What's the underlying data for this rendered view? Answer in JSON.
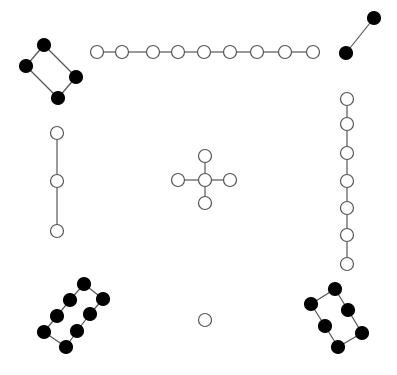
{
  "diagram": {
    "width": 397,
    "height": 375,
    "background": "#ffffff",
    "edge_color": "#555555",
    "node_radius": 6.5,
    "colors": {
      "black": "#000000",
      "white": "#ffffff",
      "stroke": "#555555"
    },
    "components": [
      {
        "name": "top-left-cycle",
        "nodes": [
          {
            "x": 44,
            "y": 45,
            "fill": "black"
          },
          {
            "x": 26,
            "y": 66,
            "fill": "black"
          },
          {
            "x": 76,
            "y": 77,
            "fill": "black"
          },
          {
            "x": 58,
            "y": 98,
            "fill": "black"
          }
        ],
        "edges": [
          [
            0,
            1
          ],
          [
            0,
            2
          ],
          [
            1,
            3
          ],
          [
            2,
            3
          ]
        ]
      },
      {
        "name": "top-horizontal-chain",
        "nodes": [
          {
            "x": 97,
            "y": 52,
            "fill": "white"
          },
          {
            "x": 122,
            "y": 52,
            "fill": "white"
          },
          {
            "x": 153,
            "y": 52,
            "fill": "white"
          },
          {
            "x": 178,
            "y": 52,
            "fill": "white"
          },
          {
            "x": 204,
            "y": 52,
            "fill": "white"
          },
          {
            "x": 230,
            "y": 52,
            "fill": "white"
          },
          {
            "x": 257,
            "y": 52,
            "fill": "white"
          },
          {
            "x": 285,
            "y": 52,
            "fill": "white"
          },
          {
            "x": 313,
            "y": 52,
            "fill": "white"
          }
        ],
        "edges": [
          [
            0,
            1
          ],
          [
            1,
            2
          ],
          [
            2,
            3
          ],
          [
            3,
            4
          ],
          [
            4,
            5
          ],
          [
            5,
            6
          ],
          [
            6,
            7
          ],
          [
            7,
            8
          ]
        ]
      },
      {
        "name": "top-right-pair",
        "nodes": [
          {
            "x": 374,
            "y": 18,
            "fill": "black"
          },
          {
            "x": 346,
            "y": 53,
            "fill": "black"
          }
        ],
        "edges": [
          [
            0,
            1
          ]
        ]
      },
      {
        "name": "left-vertical-chain",
        "nodes": [
          {
            "x": 57,
            "y": 133,
            "fill": "white"
          },
          {
            "x": 57,
            "y": 181,
            "fill": "white"
          },
          {
            "x": 57,
            "y": 231,
            "fill": "white"
          }
        ],
        "edges": [
          [
            0,
            1
          ],
          [
            1,
            2
          ]
        ]
      },
      {
        "name": "center-star",
        "nodes": [
          {
            "x": 205,
            "y": 180,
            "fill": "white"
          },
          {
            "x": 205,
            "y": 156,
            "fill": "white"
          },
          {
            "x": 178,
            "y": 180,
            "fill": "white"
          },
          {
            "x": 230,
            "y": 180,
            "fill": "white"
          },
          {
            "x": 205,
            "y": 203,
            "fill": "white"
          }
        ],
        "edges": [
          [
            0,
            1
          ],
          [
            0,
            2
          ],
          [
            0,
            3
          ],
          [
            0,
            4
          ]
        ]
      },
      {
        "name": "right-vertical-chain",
        "nodes": [
          {
            "x": 347,
            "y": 99,
            "fill": "white"
          },
          {
            "x": 347,
            "y": 124,
            "fill": "white"
          },
          {
            "x": 347,
            "y": 153,
            "fill": "white"
          },
          {
            "x": 347,
            "y": 181,
            "fill": "white"
          },
          {
            "x": 347,
            "y": 208,
            "fill": "white"
          },
          {
            "x": 347,
            "y": 235,
            "fill": "white"
          },
          {
            "x": 347,
            "y": 264,
            "fill": "white"
          }
        ],
        "edges": [
          [
            0,
            1
          ],
          [
            1,
            2
          ],
          [
            2,
            3
          ],
          [
            3,
            4
          ],
          [
            4,
            5
          ],
          [
            5,
            6
          ]
        ]
      },
      {
        "name": "bottom-left-cycle",
        "nodes": [
          {
            "x": 84,
            "y": 284,
            "fill": "black"
          },
          {
            "x": 103,
            "y": 299,
            "fill": "black"
          },
          {
            "x": 70,
            "y": 300,
            "fill": "black"
          },
          {
            "x": 90,
            "y": 314,
            "fill": "black"
          },
          {
            "x": 57,
            "y": 316,
            "fill": "black"
          },
          {
            "x": 77,
            "y": 331,
            "fill": "black"
          },
          {
            "x": 44,
            "y": 332,
            "fill": "black"
          },
          {
            "x": 66,
            "y": 347,
            "fill": "black"
          }
        ],
        "edges": [
          [
            0,
            1
          ],
          [
            0,
            2
          ],
          [
            2,
            4
          ],
          [
            4,
            6
          ],
          [
            6,
            7
          ],
          [
            7,
            5
          ],
          [
            5,
            3
          ],
          [
            3,
            1
          ]
        ]
      },
      {
        "name": "isolated-node",
        "nodes": [
          {
            "x": 205,
            "y": 320,
            "fill": "white"
          }
        ],
        "edges": []
      },
      {
        "name": "bottom-right-cycle",
        "nodes": [
          {
            "x": 335,
            "y": 289,
            "fill": "black"
          },
          {
            "x": 311,
            "y": 304,
            "fill": "black"
          },
          {
            "x": 348,
            "y": 310,
            "fill": "black"
          },
          {
            "x": 325,
            "y": 326,
            "fill": "black"
          },
          {
            "x": 362,
            "y": 333,
            "fill": "black"
          },
          {
            "x": 338,
            "y": 347,
            "fill": "black"
          }
        ],
        "edges": [
          [
            0,
            1
          ],
          [
            0,
            2
          ],
          [
            1,
            3
          ],
          [
            2,
            4
          ],
          [
            3,
            5
          ],
          [
            4,
            5
          ]
        ]
      }
    ]
  }
}
